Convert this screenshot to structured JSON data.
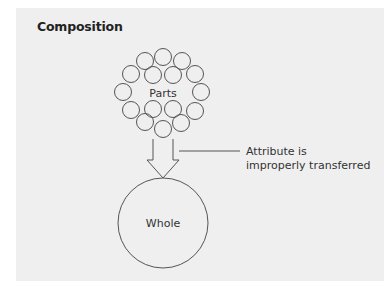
{
  "diagram": {
    "title": "Composition",
    "parts_label": "Parts",
    "whole_label": "Whole",
    "annotation": {
      "line1": "Attribute is",
      "line2": "improperly transferred"
    },
    "parts_count": 16,
    "colors": {
      "panel_bg": "#efefef",
      "stroke": "#555555",
      "text": "#333333"
    }
  }
}
